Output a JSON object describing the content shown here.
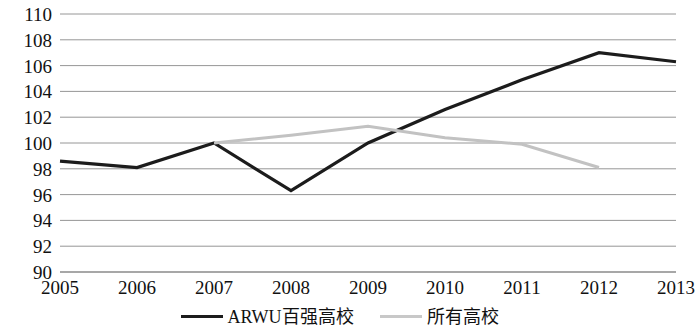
{
  "chart_data": {
    "type": "line",
    "title": "",
    "subtitle": "",
    "xlabel": "",
    "ylabel": "",
    "x": [
      2005,
      2006,
      2007,
      2008,
      2009,
      2010,
      2011,
      2012,
      2013
    ],
    "xtick_labels": [
      "2005",
      "2006",
      "2007",
      "2008",
      "2009",
      "2010",
      "2011",
      "2012",
      "2013"
    ],
    "ytick_labels": [
      "110",
      "108",
      "106",
      "104",
      "102",
      "100",
      "98",
      "96",
      "94",
      "92",
      "90"
    ],
    "yticks": [
      110,
      108,
      106,
      104,
      102,
      100,
      98,
      96,
      94,
      92,
      90
    ],
    "ylim": [
      90,
      110
    ],
    "xlim": [
      2005,
      2013
    ],
    "grid": true,
    "grid_color": "#8a8a8a",
    "legend_position": "bottom",
    "series": [
      {
        "name": "ARWU百强高校",
        "color": "#1c1c1c",
        "width": 3.2,
        "x": [
          2005,
          2006,
          2007,
          2008,
          2009,
          2010,
          2011,
          2012,
          2013
        ],
        "values": [
          98.6,
          98.1,
          100.0,
          96.3,
          100.0,
          102.6,
          104.9,
          107.0,
          106.3
        ]
      },
      {
        "name": "所有高校",
        "color": "#c2c2c2",
        "width": 3.0,
        "x": [
          2007,
          2008,
          2009,
          2010,
          2011,
          2012
        ],
        "values": [
          100.0,
          100.6,
          101.3,
          100.4,
          99.9,
          98.1
        ]
      }
    ]
  },
  "legend": {
    "items": [
      {
        "label": "ARWU百强高校",
        "color": "#1c1c1c",
        "width": "3.5px"
      },
      {
        "label": "所有高校",
        "color": "#c8c8c8",
        "width": "3px"
      }
    ]
  }
}
